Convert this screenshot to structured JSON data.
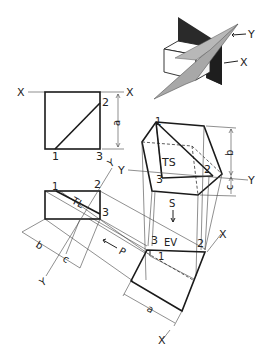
{
  "diagram": {
    "type": "descriptive geometry - true shape of oblique plane via successive auxiliary views",
    "pictorial": {
      "labels": {
        "plane_y": "Y",
        "plane_x": "X"
      }
    },
    "front_view": {
      "fold_left": "X",
      "fold_right": "X",
      "points": {
        "p1": "1",
        "p2": "2",
        "p3": "3"
      },
      "dim": "a"
    },
    "top_view": {
      "points": {
        "p1": "1",
        "p2": "2",
        "p3": "3"
      },
      "line_label": "TL",
      "fold_label": "Y",
      "dim_b": "b",
      "dim_c": "c",
      "arrow_label": "P"
    },
    "edge_view": {
      "points": {
        "p1": "1",
        "p2": "2",
        "p3": "3"
      },
      "label": "EV",
      "fold_top": "X",
      "fold_bottom": "X",
      "dim": "a"
    },
    "true_shape_view": {
      "points": {
        "p1": "1",
        "p2": "2",
        "p3": "3"
      },
      "label": "TS",
      "fold_left": "Y",
      "fold_right": "Y",
      "dim_b": "b",
      "dim_c": "c",
      "arrow_label": "S"
    }
  }
}
